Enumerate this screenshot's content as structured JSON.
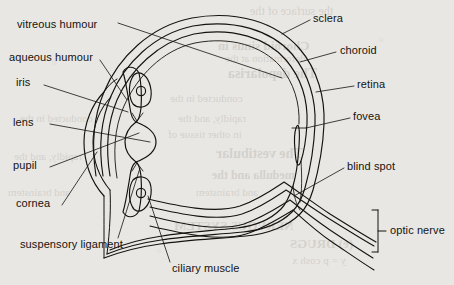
{
  "figure": {
    "paper_color": "#e9e7e3",
    "ink_color": "#15130f"
  },
  "labels": {
    "vitreous_humour": "vitreous humour",
    "aqueous_humour": "aqueous humour",
    "iris": "iris",
    "lens": "lens",
    "pupil": "pupil",
    "cornea": "cornea",
    "suspensory_ligament": "suspensory ligament",
    "ciliary_muscle": "ciliary muscle",
    "sclera": "sclera",
    "choroid": "choroid",
    "retina": "retina",
    "fovea": "fovea",
    "blind_spot": "blind spot",
    "optic_nerve": "optic nerve"
  },
  "bleed_through": [
    "the surface of the",
    "Choroid sinus in",
    "deformation at the",
    "The depolarisa",
    "conducted in the",
    "rapidly, and the",
    "in other tissue of",
    "The vestibular",
    "medulla and the",
    "and brainstem",
    "NERVOUS SYSTEM",
    "(e) DRUGS",
    "y = p cosh x"
  ]
}
